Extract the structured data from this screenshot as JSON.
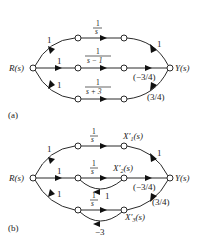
{
  "diagram_a": {
    "tag": "(a)",
    "input_label": "R(s)",
    "output_label": "Y(s)",
    "branch_gains": {
      "top_in": "1",
      "mid_in": "1",
      "bot_in": "1"
    },
    "forward_tf": {
      "top": {
        "num": "1",
        "den": "s"
      },
      "mid": {
        "num": "1",
        "den": "s − 1"
      },
      "bot": {
        "num": "1",
        "den": "s + 3"
      }
    },
    "output_gains": {
      "top": "1",
      "mid": "(−3/4)",
      "bot": "(3/4)"
    }
  },
  "diagram_b": {
    "tag": "(b)",
    "input_label": "R(s)",
    "output_label": "Y(s)",
    "branch_gains": {
      "top_in": "1",
      "mid_in": "1",
      "bot_in": "1"
    },
    "forward_tf": {
      "top": {
        "num": "1",
        "den": "s"
      },
      "mid": {
        "num": "1",
        "den": "s"
      },
      "bot": {
        "num": "1",
        "den": "s"
      }
    },
    "state_labels": {
      "x1": "X′",
      "x1_sub": "1",
      "x2": "X′",
      "x2_sub": "2",
      "x3": "X′",
      "x3_sub": "3",
      "suffix": "(s)"
    },
    "feedback_gains": {
      "mid": "1",
      "bot": "−3"
    },
    "mid_feedback_tf": {
      "num": "1",
      "den": "s"
    },
    "output_gains": {
      "top": "1",
      "mid": "(−3/4)",
      "bot": "(3/4)"
    }
  }
}
